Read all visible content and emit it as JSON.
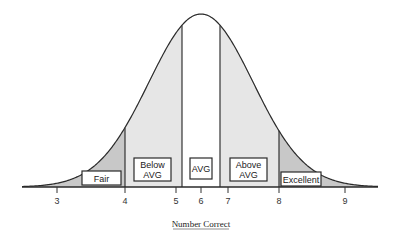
{
  "chart_data": {
    "type": "area",
    "title": "",
    "xlabel": "Number Correct",
    "ylabel": "",
    "x_ticks": [
      3,
      4,
      5,
      6,
      7,
      8,
      9
    ],
    "x_tick_labels": [
      "3",
      "4",
      "5",
      "6",
      "7",
      "8",
      "9"
    ],
    "distribution": "normal",
    "mean": 6,
    "grid": false,
    "legend": null,
    "regions": [
      {
        "name": "Fair",
        "range": [
          null,
          4
        ],
        "shade": "dark-gray",
        "color": "#c8c8c8"
      },
      {
        "name": "Below AVG",
        "range": [
          4,
          5.2
        ],
        "shade": "light-gray",
        "color": "#e6e6e6"
      },
      {
        "name": "AVG",
        "range": [
          5.2,
          6.8
        ],
        "shade": "white",
        "color": "#ffffff"
      },
      {
        "name": "Above AVG",
        "range": [
          6.8,
          8
        ],
        "shade": "light-gray",
        "color": "#e6e6e6"
      },
      {
        "name": "Excellent",
        "range": [
          8,
          null
        ],
        "shade": "dark-gray",
        "color": "#c8c8c8"
      }
    ]
  },
  "labels": {
    "fair": "Fair",
    "below_avg_line1": "Below",
    "below_avg_line2": "AVG",
    "avg": "AVG",
    "above_avg_line1": "Above",
    "above_avg_line2": "AVG",
    "excellent": "Excellent"
  },
  "ticks": {
    "t3": "3",
    "t4": "4",
    "t5": "5",
    "t6": "6",
    "t7": "7",
    "t8": "8",
    "t9": "9"
  },
  "axis": {
    "xlabel": "Number Correct"
  }
}
